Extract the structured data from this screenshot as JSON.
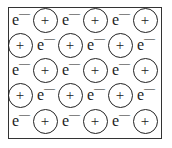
{
  "diagram": {
    "electron_label": "e",
    "electron_charge": "—",
    "ion_label": "+",
    "rows": [
      [
        "e",
        "+",
        "e",
        "+",
        "e",
        "+"
      ],
      [
        "+",
        "e",
        "+",
        "e",
        "+",
        "e"
      ],
      [
        "e",
        "+",
        "e",
        "+",
        "e",
        "+"
      ],
      [
        "+",
        "e",
        "+",
        "e",
        "+",
        "e"
      ],
      [
        "e",
        "+",
        "e",
        "+",
        "e",
        "+"
      ]
    ]
  }
}
